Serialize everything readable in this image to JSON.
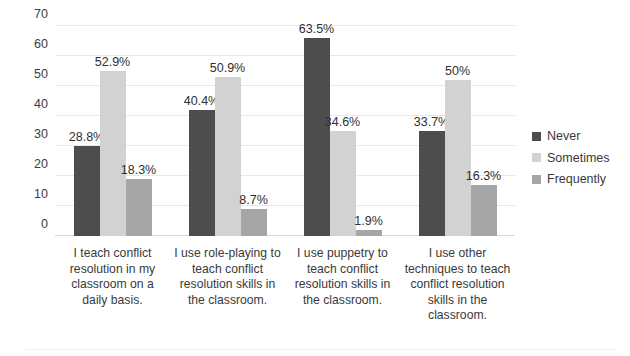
{
  "chart_data": {
    "type": "bar",
    "title": "",
    "subtitle": "",
    "xlabel": "",
    "ylabel": "",
    "ylim": [
      0,
      70
    ],
    "yticks": [
      0,
      10,
      20,
      30,
      40,
      50,
      60,
      70
    ],
    "grid": true,
    "legend_position": "right",
    "categories": [
      "I teach conflict resolution in my classroom on a daily basis.",
      "I use role-playing to teach conflict resolution skills in the classroom.",
      "I use puppetry to teach conflict resolution skills in the classroom.",
      "I use other techniques to teach conflict resolution skills in the classroom."
    ],
    "series": [
      {
        "name": "Never",
        "color": "#4d4d4d",
        "values": [
          30.0,
          42.0,
          66.0,
          35.0
        ],
        "labels": [
          "28.8%",
          "40.4%",
          "63.5%",
          "33.7%"
        ]
      },
      {
        "name": "Sometimes",
        "color": "#d2d2d2",
        "values": [
          55.0,
          53.0,
          35.0,
          52.0
        ],
        "labels": [
          "52.9%",
          "50.9%",
          "34.6%",
          "50%"
        ]
      },
      {
        "name": "Frequently",
        "color": "#a6a6a6",
        "values": [
          19.0,
          9.0,
          2.0,
          17.0
        ],
        "labels": [
          "18.3%",
          "8.7%",
          "1.9%",
          "16.3%"
        ]
      }
    ]
  },
  "axis": {
    "ytick_labels": [
      "70",
      "60",
      "50",
      "40",
      "30",
      "20",
      "10",
      "0"
    ]
  },
  "legend": {
    "items": [
      {
        "label": "Never",
        "color": "#4d4d4d"
      },
      {
        "label": "Sometimes",
        "color": "#d2d2d2"
      },
      {
        "label": "Frequently",
        "color": "#a6a6a6"
      }
    ]
  }
}
